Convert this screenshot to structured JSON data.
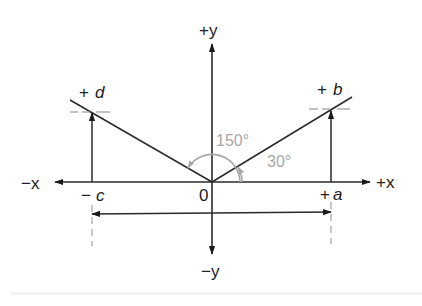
{
  "diagram": {
    "axes": {
      "pos_x_label": "+x",
      "neg_x_label": "−x",
      "pos_y_label": "+y",
      "neg_y_label": "−y",
      "origin_label": "0"
    },
    "points": {
      "a": {
        "sign": "+",
        "var": "a"
      },
      "b": {
        "sign": "+",
        "var": "b"
      },
      "c": {
        "sign": "−",
        "var": "c"
      },
      "d": {
        "sign": "+",
        "var": "d"
      }
    },
    "angles": {
      "small": "30°",
      "large": "150°"
    },
    "colors": {
      "line": "#2a2a2a",
      "angle": "#a8a8a8",
      "dash": "#9a9a9a"
    }
  }
}
